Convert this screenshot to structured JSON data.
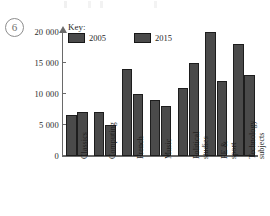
{
  "question_number": "6",
  "legend": {
    "title": "Key:",
    "entries": [
      {
        "label": "2005",
        "color": "#4a4a4a"
      },
      {
        "label": "2015",
        "color": "#4a4a4a"
      }
    ]
  },
  "chart_data": {
    "type": "bar",
    "title": "",
    "xlabel": "",
    "ylabel": "",
    "ylim": [
      0,
      20000
    ],
    "yticks": [
      0,
      5000,
      10000,
      15000,
      20000
    ],
    "ytick_labels": [
      "0",
      "5 000",
      "10 000",
      "15 000",
      "20 000"
    ],
    "grid": false,
    "legend_position": "top-left",
    "categories": [
      "Classics",
      "Computing",
      "French",
      "Music",
      "Political\nstudies",
      "PE &\nsport",
      "Technology\nsubjects"
    ],
    "series": [
      {
        "name": "2005",
        "color": "#4a4a4a",
        "values": [
          6500,
          7000,
          14000,
          9000,
          11000,
          20000,
          18000
        ]
      },
      {
        "name": "2015",
        "color": "#4a4a4a",
        "values": [
          7000,
          5000,
          10000,
          8000,
          15000,
          12000,
          13000
        ]
      }
    ]
  }
}
